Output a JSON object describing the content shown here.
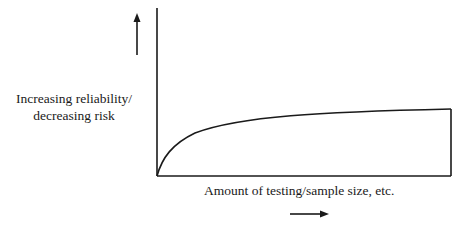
{
  "diagram": {
    "y_label_line1": "Increasing reliability/",
    "y_label_line2": "decreasing risk",
    "x_label": "Amount of testing/sample size, etc.",
    "stroke_color": "#1a1a1a",
    "background": "#ffffff"
  }
}
